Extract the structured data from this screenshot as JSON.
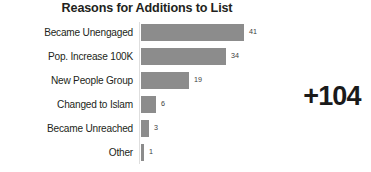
{
  "chart_data": {
    "type": "bar",
    "orientation": "horizontal",
    "title": "Reasons for Additions to List",
    "xlabel": "",
    "ylabel": "",
    "categories": [
      "Became Unengaged",
      "Pop. Increase 100K",
      "New People Group",
      "Changed to Islam",
      "Became Unreached",
      "Other"
    ],
    "values": [
      41,
      34,
      19,
      6,
      3,
      1
    ],
    "value_labels": [
      "41",
      "34",
      "19",
      "6",
      "3",
      "1"
    ],
    "xlim": [
      0,
      41
    ],
    "grid": false,
    "legend": null,
    "bar_color": "#8c8c8c",
    "axis_color": "#dedede",
    "text_color": "#231f20",
    "background_color": "#ffffff",
    "annotations": [
      {
        "name": "total-additions",
        "text": "+104",
        "color": "#1a1a1a"
      }
    ]
  }
}
